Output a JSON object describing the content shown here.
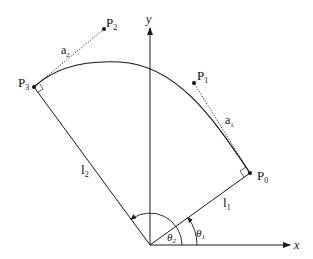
{
  "diagram": {
    "axes": {
      "x_label": "x",
      "y_label": "y"
    },
    "points": {
      "P0": {
        "label": "P",
        "sub": "0"
      },
      "P1": {
        "label": "P",
        "sub": "1"
      },
      "P2": {
        "label": "P",
        "sub": "2"
      },
      "P3": {
        "label": "P",
        "sub": "3"
      }
    },
    "links": {
      "l1": {
        "label": "l",
        "sub": "1"
      },
      "l2": {
        "label": "l",
        "sub": "2"
      }
    },
    "tangents": {
      "a1": {
        "label": "a",
        "sub": "1"
      },
      "a2": {
        "label": "a",
        "sub": "2"
      }
    },
    "angles": {
      "theta1": {
        "label": "θ",
        "sub": "1"
      },
      "theta2": {
        "label": "θ",
        "sub": "2"
      }
    },
    "colors": {
      "line": "#1a1a1a",
      "background": "#ffffff"
    }
  }
}
